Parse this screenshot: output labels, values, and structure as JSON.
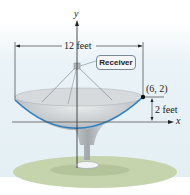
{
  "figure": {
    "type": "parabolic-dish-diagram",
    "axes": {
      "x_label": "x",
      "y_label": "y"
    },
    "labels": {
      "width": "12 feet",
      "depth": "2 feet",
      "point": "(6, 2)",
      "receiver": "Receiver"
    },
    "colors": {
      "parabola": "#2a7fc0",
      "dish": "#c9cdd0",
      "ground": "#c8d6b0",
      "sky": "#e6f1f6",
      "axis": "#333333"
    }
  }
}
